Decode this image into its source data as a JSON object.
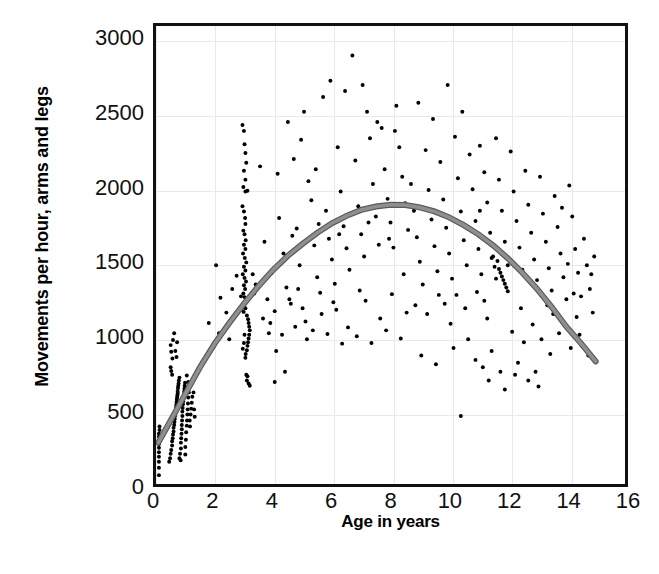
{
  "chart_data": {
    "type": "scatter",
    "title": "",
    "xlabel": "Age in years",
    "ylabel": "Movements per hour, arms and legs",
    "xlim": [
      0,
      16
    ],
    "ylim": [
      0,
      3100
    ],
    "xticks": [
      0,
      2,
      4,
      6,
      8,
      10,
      12,
      14,
      16
    ],
    "yticks": [
      0,
      500,
      1000,
      1500,
      2000,
      2500,
      3000
    ],
    "grid": true,
    "legend": "none",
    "marker_color": "#000000",
    "marker_size": 4,
    "fit_curve": {
      "name": "quadratic fit",
      "color": "#8f8f8f",
      "edge_color": "#5a5a5a",
      "width": 6,
      "x_start": 0.08,
      "x_end": 15.0,
      "peak_x": 8.3,
      "peak_y": 1890,
      "y_start": 280,
      "y_end": 830,
      "points": [
        [
          0.08,
          280
        ],
        [
          0.5,
          430
        ],
        [
          1.0,
          610
        ],
        [
          1.5,
          790
        ],
        [
          2.0,
          950
        ],
        [
          2.5,
          1090
        ],
        [
          3.0,
          1220
        ],
        [
          3.5,
          1340
        ],
        [
          4.0,
          1450
        ],
        [
          4.5,
          1545
        ],
        [
          5.0,
          1625
        ],
        [
          5.5,
          1700
        ],
        [
          6.0,
          1765
        ],
        [
          6.5,
          1815
        ],
        [
          7.0,
          1855
        ],
        [
          7.5,
          1878
        ],
        [
          8.0,
          1890
        ],
        [
          8.5,
          1888
        ],
        [
          9.0,
          1872
        ],
        [
          9.5,
          1845
        ],
        [
          10.0,
          1805
        ],
        [
          10.5,
          1752
        ],
        [
          11.0,
          1690
        ],
        [
          11.5,
          1615
        ],
        [
          12.0,
          1528
        ],
        [
          12.5,
          1430
        ],
        [
          13.0,
          1320
        ],
        [
          13.5,
          1198
        ],
        [
          14.0,
          1065
        ],
        [
          14.5,
          952
        ],
        [
          15.0,
          830
        ]
      ]
    },
    "points": [
      [
        0.1,
        60
      ],
      [
        0.1,
        110
      ],
      [
        0.1,
        150
      ],
      [
        0.1,
        185
      ],
      [
        0.1,
        215
      ],
      [
        0.1,
        245
      ],
      [
        0.1,
        270
      ],
      [
        0.1,
        295
      ],
      [
        0.1,
        320
      ],
      [
        0.1,
        340
      ],
      [
        0.12,
        365
      ],
      [
        0.12,
        390
      ],
      [
        0.45,
        150
      ],
      [
        0.48,
        175
      ],
      [
        0.5,
        205
      ],
      [
        0.52,
        230
      ],
      [
        0.55,
        260
      ],
      [
        0.55,
        290
      ],
      [
        0.57,
        310
      ],
      [
        0.58,
        335
      ],
      [
        0.6,
        355
      ],
      [
        0.6,
        380
      ],
      [
        0.62,
        400
      ],
      [
        0.63,
        420
      ],
      [
        0.64,
        440
      ],
      [
        0.65,
        460
      ],
      [
        0.66,
        480
      ],
      [
        0.67,
        495
      ],
      [
        0.68,
        510
      ],
      [
        0.69,
        525
      ],
      [
        0.7,
        540
      ],
      [
        0.7,
        555
      ],
      [
        0.71,
        570
      ],
      [
        0.72,
        585
      ],
      [
        0.73,
        600
      ],
      [
        0.74,
        615
      ],
      [
        0.74,
        630
      ],
      [
        0.75,
        650
      ],
      [
        0.76,
        665
      ],
      [
        0.77,
        680
      ],
      [
        0.78,
        700
      ],
      [
        0.8,
        720
      ],
      [
        0.55,
        740
      ],
      [
        0.52,
        765
      ],
      [
        0.5,
        790
      ],
      [
        0.56,
        850
      ],
      [
        0.52,
        895
      ],
      [
        0.5,
        940
      ],
      [
        0.58,
        975
      ],
      [
        0.62,
        1020
      ],
      [
        0.66,
        900
      ],
      [
        0.7,
        860
      ],
      [
        0.72,
        960
      ],
      [
        0.85,
        240
      ],
      [
        0.85,
        280
      ],
      [
        0.86,
        310
      ],
      [
        0.87,
        340
      ],
      [
        0.88,
        370
      ],
      [
        0.88,
        400
      ],
      [
        0.89,
        430
      ],
      [
        0.9,
        460
      ],
      [
        0.9,
        490
      ],
      [
        0.91,
        515
      ],
      [
        0.92,
        540
      ],
      [
        0.93,
        560
      ],
      [
        0.94,
        580
      ],
      [
        0.95,
        600
      ],
      [
        0.96,
        625
      ],
      [
        0.97,
        645
      ],
      [
        0.98,
        665
      ],
      [
        0.99,
        685
      ],
      [
        1.0,
        200
      ],
      [
        1.0,
        250
      ],
      [
        1.02,
        300
      ],
      [
        1.03,
        350
      ],
      [
        1.05,
        395
      ],
      [
        1.06,
        430
      ],
      [
        1.07,
        470
      ],
      [
        1.08,
        505
      ],
      [
        1.09,
        545
      ],
      [
        1.1,
        585
      ],
      [
        1.12,
        620
      ],
      [
        1.13,
        660
      ],
      [
        1.15,
        430
      ],
      [
        1.16,
        390
      ],
      [
        1.18,
        470
      ],
      [
        1.2,
        510
      ],
      [
        1.22,
        550
      ],
      [
        1.24,
        590
      ],
      [
        1.05,
        735
      ],
      [
        1.1,
        690
      ],
      [
        1.28,
        620
      ],
      [
        1.3,
        505
      ],
      [
        1.32,
        455
      ],
      [
        0.8,
        175
      ],
      [
        0.82,
        205
      ],
      [
        0.84,
        160
      ],
      [
        2.95,
        2430
      ],
      [
        3.0,
        2390
      ],
      [
        3.02,
        2300
      ],
      [
        3.05,
        2240
      ],
      [
        3.08,
        2175
      ],
      [
        3.0,
        2120
      ],
      [
        3.05,
        2060
      ],
      [
        2.98,
        2010
      ],
      [
        3.05,
        1980
      ],
      [
        3.12,
        1985
      ],
      [
        2.95,
        1880
      ],
      [
        3.0,
        1845
      ],
      [
        3.04,
        1800
      ],
      [
        3.05,
        1760
      ],
      [
        2.98,
        1715
      ],
      [
        3.02,
        1690
      ],
      [
        3.06,
        1650
      ],
      [
        3.0,
        1620
      ],
      [
        3.05,
        1590
      ],
      [
        2.97,
        1560
      ],
      [
        3.03,
        1530
      ],
      [
        3.08,
        1500
      ],
      [
        3.0,
        1470
      ],
      [
        3.05,
        1445
      ],
      [
        2.96,
        1420
      ],
      [
        3.02,
        1395
      ],
      [
        3.07,
        1370
      ],
      [
        3.0,
        1345
      ],
      [
        3.04,
        1320
      ],
      [
        2.98,
        1290
      ],
      [
        3.02,
        1265
      ],
      [
        3.06,
        1240
      ],
      [
        3.0,
        1215
      ],
      [
        3.05,
        1190
      ],
      [
        2.99,
        1165
      ],
      [
        3.1,
        1140
      ],
      [
        3.14,
        1115
      ],
      [
        3.16,
        1090
      ],
      [
        3.18,
        1065
      ],
      [
        3.2,
        1040
      ],
      [
        3.18,
        1010
      ],
      [
        3.16,
        985
      ],
      [
        3.14,
        960
      ],
      [
        3.12,
        935
      ],
      [
        3.1,
        905
      ],
      [
        3.06,
        880
      ],
      [
        3.05,
        855
      ],
      [
        3.08,
        740
      ],
      [
        3.12,
        730
      ],
      [
        3.1,
        700
      ],
      [
        3.16,
        680
      ],
      [
        3.2,
        665
      ],
      [
        3.02,
        1010
      ],
      [
        3.0,
        955
      ],
      [
        2.96,
        915
      ],
      [
        2.9,
        1270
      ],
      [
        2.92,
        1180
      ],
      [
        3.3,
        1420
      ],
      [
        3.35,
        1290
      ],
      [
        3.4,
        1350
      ],
      [
        3.55,
        2150
      ],
      [
        3.7,
        1640
      ],
      [
        3.8,
        1250
      ],
      [
        3.9,
        1090
      ],
      [
        3.95,
        1430
      ],
      [
        4.1,
        900
      ],
      [
        4.2,
        1800
      ],
      [
        4.35,
        1560
      ],
      [
        4.45,
        1330
      ],
      [
        4.6,
        1220
      ],
      [
        4.7,
        2200
      ],
      [
        4.8,
        1730
      ],
      [
        4.9,
        1480
      ],
      [
        5.0,
        1190
      ],
      [
        5.1,
        1100
      ],
      [
        5.2,
        2050
      ],
      [
        5.3,
        1920
      ],
      [
        5.4,
        1615
      ],
      [
        5.5,
        1400
      ],
      [
        5.6,
        1295
      ],
      [
        4.15,
        2100
      ],
      [
        4.5,
        2450
      ],
      [
        4.95,
        2330
      ],
      [
        5.05,
        2520
      ],
      [
        5.45,
        2130
      ],
      [
        5.7,
        2620
      ],
      [
        5.8,
        1850
      ],
      [
        5.9,
        1660
      ],
      [
        6.0,
        1520
      ],
      [
        6.1,
        1355
      ],
      [
        6.2,
        2280
      ],
      [
        6.3,
        1980
      ],
      [
        6.4,
        1745
      ],
      [
        6.5,
        1595
      ],
      [
        6.6,
        1450
      ],
      [
        6.7,
        2900
      ],
      [
        6.8,
        2190
      ],
      [
        6.9,
        1880
      ],
      [
        7.0,
        1690
      ],
      [
        7.1,
        1540
      ],
      [
        7.2,
        2520
      ],
      [
        7.3,
        2340
      ],
      [
        7.4,
        2030
      ],
      [
        7.5,
        1810
      ],
      [
        7.6,
        1620
      ],
      [
        7.7,
        2410
      ],
      [
        7.8,
        2130
      ],
      [
        7.9,
        1930
      ],
      [
        8.0,
        1770
      ],
      [
        8.1,
        1600
      ],
      [
        8.2,
        2560
      ],
      [
        8.3,
        2280
      ],
      [
        8.4,
        2080
      ],
      [
        8.5,
        1900
      ],
      [
        8.6,
        1720
      ],
      [
        5.95,
        2730
      ],
      [
        6.45,
        2660
      ],
      [
        7.05,
        2700
      ],
      [
        7.55,
        2450
      ],
      [
        8.15,
        2390
      ],
      [
        4.3,
        1010
      ],
      [
        4.75,
        1065
      ],
      [
        5.15,
        980
      ],
      [
        5.65,
        1150
      ],
      [
        6.15,
        1180
      ],
      [
        6.55,
        1060
      ],
      [
        7.15,
        1240
      ],
      [
        7.65,
        1120
      ],
      [
        8.05,
        1285
      ],
      [
        8.55,
        1160
      ],
      [
        3.65,
        1120
      ],
      [
        3.85,
        1020
      ],
      [
        4.05,
        1170
      ],
      [
        4.55,
        1250
      ],
      [
        4.85,
        1320
      ],
      [
        8.7,
        2030
      ],
      [
        8.8,
        1850
      ],
      [
        8.9,
        1670
      ],
      [
        9.0,
        1505
      ],
      [
        9.1,
        1350
      ],
      [
        9.2,
        2260
      ],
      [
        9.3,
        1990
      ],
      [
        9.4,
        1790
      ],
      [
        9.5,
        1610
      ],
      [
        9.6,
        1440
      ],
      [
        9.7,
        2180
      ],
      [
        9.8,
        1925
      ],
      [
        9.9,
        1735
      ],
      [
        10.0,
        1560
      ],
      [
        10.1,
        1390
      ],
      [
        10.2,
        2350
      ],
      [
        10.3,
        2070
      ],
      [
        10.4,
        1845
      ],
      [
        10.5,
        1650
      ],
      [
        10.6,
        1480
      ],
      [
        10.7,
        2230
      ],
      [
        10.8,
        1995
      ],
      [
        10.9,
        1780
      ],
      [
        11.0,
        1590
      ],
      [
        11.1,
        1420
      ],
      [
        8.95,
        2580
      ],
      [
        9.45,
        2470
      ],
      [
        9.95,
        2700
      ],
      [
        10.45,
        2520
      ],
      [
        11.05,
        2290
      ],
      [
        8.85,
        1210
      ],
      [
        9.25,
        1150
      ],
      [
        9.65,
        1280
      ],
      [
        10.05,
        1085
      ],
      [
        10.55,
        1190
      ],
      [
        10.95,
        1300
      ],
      [
        10.4,
        460
      ],
      [
        10.9,
        840
      ],
      [
        11.2,
        1240
      ],
      [
        11.3,
        1120
      ],
      [
        11.2,
        2110
      ],
      [
        11.3,
        1905
      ],
      [
        11.4,
        1700
      ],
      [
        11.5,
        1540
      ],
      [
        11.6,
        1390
      ],
      [
        11.6,
        2340
      ],
      [
        11.7,
        2060
      ],
      [
        11.8,
        1850
      ],
      [
        11.9,
        1640
      ],
      [
        12.0,
        1480
      ],
      [
        11.45,
        1530
      ],
      [
        11.55,
        1470
      ],
      [
        11.65,
        1510
      ],
      [
        11.7,
        1455
      ],
      [
        11.75,
        1430
      ],
      [
        11.8,
        1405
      ],
      [
        11.85,
        1380
      ],
      [
        11.9,
        1355
      ],
      [
        11.95,
        1330
      ],
      [
        12.0,
        1305
      ],
      [
        12.1,
        2250
      ],
      [
        12.2,
        1980
      ],
      [
        12.3,
        1780
      ],
      [
        12.4,
        1600
      ],
      [
        12.5,
        1450
      ],
      [
        12.6,
        2120
      ],
      [
        12.7,
        1890
      ],
      [
        12.8,
        1700
      ],
      [
        12.9,
        1520
      ],
      [
        13.0,
        1380
      ],
      [
        12.15,
        1030
      ],
      [
        12.55,
        960
      ],
      [
        12.85,
        1080
      ],
      [
        13.1,
        2080
      ],
      [
        13.2,
        1830
      ],
      [
        13.3,
        1640
      ],
      [
        13.4,
        1460
      ],
      [
        13.5,
        1310
      ],
      [
        13.6,
        1950
      ],
      [
        13.7,
        1740
      ],
      [
        13.8,
        1560
      ],
      [
        13.9,
        1400
      ],
      [
        14.0,
        1250
      ],
      [
        13.15,
        980
      ],
      [
        13.45,
        880
      ],
      [
        13.75,
        1020
      ],
      [
        14.1,
        2020
      ],
      [
        14.2,
        1810
      ],
      [
        14.3,
        1590
      ],
      [
        14.4,
        1430
      ],
      [
        14.5,
        1270
      ],
      [
        14.6,
        1660
      ],
      [
        14.7,
        1480
      ],
      [
        14.8,
        1320
      ],
      [
        14.9,
        1160
      ],
      [
        14.15,
        920
      ],
      [
        14.45,
        1010
      ],
      [
        14.75,
        870
      ],
      [
        12.35,
        820
      ],
      [
        12.95,
        760
      ],
      [
        11.35,
        700
      ],
      [
        11.9,
        640
      ],
      [
        12.7,
        700
      ],
      [
        13.05,
        660
      ],
      [
        11.15,
        790
      ],
      [
        11.75,
        760
      ],
      [
        12.25,
        740
      ],
      [
        13.55,
        1150
      ],
      [
        13.95,
        1080
      ],
      [
        14.35,
        1130
      ],
      [
        2.05,
        1480
      ],
      [
        2.2,
        1260
      ],
      [
        2.4,
        1160
      ],
      [
        2.6,
        1320
      ],
      [
        2.75,
        1410
      ],
      [
        1.8,
        1090
      ],
      [
        2.15,
        1020
      ],
      [
        2.5,
        980
      ],
      [
        4.4,
        760
      ],
      [
        4.05,
        690
      ],
      [
        9.05,
        870
      ],
      [
        9.55,
        810
      ],
      [
        10.15,
        920
      ],
      [
        10.65,
        980
      ],
      [
        11.45,
        900
      ],
      [
        5.35,
        1040
      ],
      [
        5.85,
        1015
      ],
      [
        6.35,
        950
      ],
      [
        6.85,
        1000
      ],
      [
        7.35,
        955
      ],
      [
        7.85,
        1040
      ],
      [
        8.35,
        985
      ],
      [
        8.45,
        1420
      ],
      [
        6.05,
        1230
      ],
      [
        6.95,
        1310
      ],
      [
        4.65,
        1680
      ],
      [
        5.55,
        1760
      ],
      [
        6.25,
        1690
      ],
      [
        7.25,
        1770
      ],
      [
        7.95,
        1660
      ],
      [
        12.45,
        1190
      ],
      [
        13.35,
        1210
      ],
      [
        14.05,
        1490
      ],
      [
        14.85,
        1420
      ],
      [
        14.95,
        1540
      ],
      [
        13.85,
        1870
      ],
      [
        14.25,
        1290
      ],
      [
        11.05,
        1850
      ],
      [
        10.25,
        1280
      ],
      [
        9.85,
        1220
      ]
    ]
  },
  "caption": ""
}
